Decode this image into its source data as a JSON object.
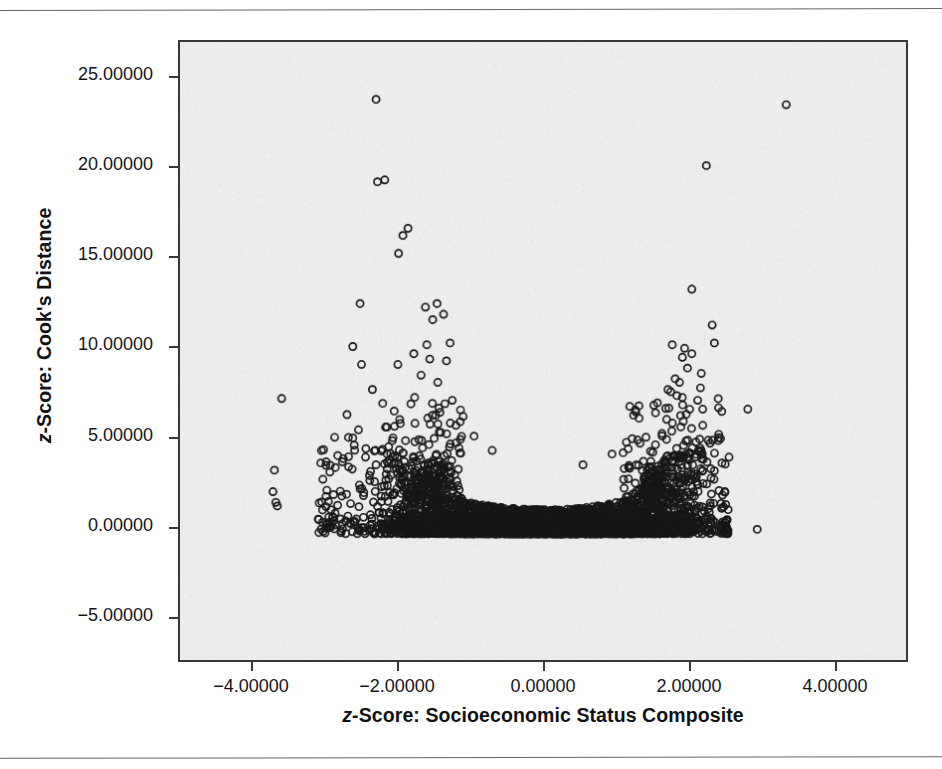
{
  "figure": {
    "background_color": "#ffffff",
    "plot_background_color": "#ececec",
    "frame_color": "#38383c",
    "marker_color": "#17171a"
  },
  "chart_data": {
    "type": "scatter",
    "title": "",
    "subtitle": "",
    "xlabel": "z-Score: Socioeconomic Status Composite",
    "ylabel": "z-Score: Cook's Distance",
    "xlabel_lead": "z",
    "xlabel_rest": "-Score: Socioeconomic Status Composite",
    "ylabel_lead": "z",
    "ylabel_rest": "-Score: Cook's Distance",
    "xlim": [
      -5.0,
      5.0
    ],
    "ylim": [
      -7.5,
      27.0
    ],
    "grid": false,
    "legend": "none",
    "marker": "open-circle",
    "marker_size_px": 8,
    "point_count_approx": 4000,
    "xticks": [
      -4.0,
      -2.0,
      0.0,
      2.0,
      4.0
    ],
    "yticks": [
      -5.0,
      0.0,
      5.0,
      10.0,
      15.0,
      20.0,
      25.0
    ],
    "xtick_labels": [
      "-4.00000",
      "-2.00000",
      "0.00000",
      "2.00000",
      "4.00000"
    ],
    "ytick_labels": [
      "25.00000",
      "20.00000",
      "15.00000",
      "10.00000",
      "5.00000",
      "0.00000",
      "-5.00000"
    ],
    "dense_band": {
      "x_min": -3.0,
      "x_max": 2.55,
      "y_floor": -0.45,
      "envelope_note": "upper edge dips to ~1.2 near x=0 and rises to ~4.5 near x=-2 and x=+2"
    },
    "notable_outliers": [
      {
        "x": -2.3,
        "y": 23.8
      },
      {
        "x": 3.35,
        "y": 23.5
      },
      {
        "x": -2.28,
        "y": 19.2
      },
      {
        "x": -2.18,
        "y": 19.3
      },
      {
        "x": 2.25,
        "y": 20.1
      },
      {
        "x": -1.86,
        "y": 16.6
      },
      {
        "x": -1.93,
        "y": 16.2
      },
      {
        "x": -1.99,
        "y": 15.2
      },
      {
        "x": 2.05,
        "y": 13.2
      },
      {
        "x": -1.46,
        "y": 12.4
      },
      {
        "x": -2.52,
        "y": 12.4
      },
      {
        "x": -1.62,
        "y": 12.2
      },
      {
        "x": -1.37,
        "y": 11.8
      },
      {
        "x": -1.52,
        "y": 11.5
      },
      {
        "x": 2.33,
        "y": 11.2
      },
      {
        "x": 2.36,
        "y": 10.2
      },
      {
        "x": -2.62,
        "y": 10.0
      },
      {
        "x": -1.78,
        "y": 9.6
      },
      {
        "x": -1.56,
        "y": 9.3
      },
      {
        "x": -1.33,
        "y": 9.2
      },
      {
        "x": 1.92,
        "y": 9.4
      },
      {
        "x": 1.99,
        "y": 8.8
      },
      {
        "x": -2.35,
        "y": 7.6
      },
      {
        "x": -3.6,
        "y": 7.1
      },
      {
        "x": -1.25,
        "y": 7.0
      },
      {
        "x": 2.13,
        "y": 7.0
      },
      {
        "x": -2.7,
        "y": 6.2
      },
      {
        "x": -3.7,
        "y": 3.1
      },
      {
        "x": -3.72,
        "y": 1.9
      },
      {
        "x": -3.68,
        "y": 1.3
      },
      {
        "x": -3.66,
        "y": 1.1
      },
      {
        "x": 2.95,
        "y": -0.2
      }
    ]
  }
}
